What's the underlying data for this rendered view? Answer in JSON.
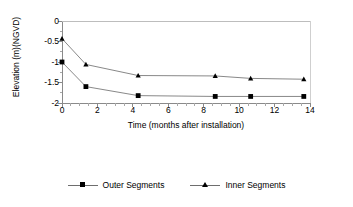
{
  "chart_data": {
    "type": "line",
    "title": "",
    "xlabel": "Time (months after installation)",
    "ylabel": "Elevation (m)(NGVD)",
    "xlim": [
      0,
      14
    ],
    "ylim": [
      -2,
      0
    ],
    "xticks": [
      0,
      2,
      4,
      6,
      8,
      10,
      12,
      14
    ],
    "xtick_labels": [
      "0",
      "2",
      "4",
      "6",
      "8",
      "10",
      "12",
      "14"
    ],
    "x_minor_tick_interval": 0.5,
    "yticks": [
      0,
      -0.5,
      -1,
      -1.5,
      -2
    ],
    "ytick_labels": [
      "0",
      "-0.5",
      "-1",
      "-1.5",
      "-2"
    ],
    "grid": false,
    "legend_position": "bottom",
    "series": [
      {
        "name": "Outer Segments",
        "marker": "square",
        "color": "#000000",
        "line_color": "#7a7a7a",
        "x": [
          0,
          1.35,
          4.3,
          8.65,
          10.65,
          13.65
        ],
        "values": [
          -1.0,
          -1.6,
          -1.82,
          -1.84,
          -1.84,
          -1.84
        ]
      },
      {
        "name": "Inner Segments",
        "marker": "triangle",
        "color": "#000000",
        "line_color": "#7a7a7a",
        "x": [
          0,
          1.35,
          4.3,
          8.65,
          10.65,
          13.65
        ],
        "values": [
          -0.43,
          -1.06,
          -1.33,
          -1.34,
          -1.4,
          -1.42
        ]
      }
    ]
  },
  "legend": {
    "items": [
      {
        "label": "Outer Segments",
        "marker": "square"
      },
      {
        "label": "Inner Segments",
        "marker": "triangle"
      }
    ]
  },
  "colors": {
    "axis": "#808080",
    "line": "#7a7a7a",
    "marker": "#000000",
    "text": "#000000",
    "background": "#ffffff"
  }
}
